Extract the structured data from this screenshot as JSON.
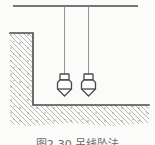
{
  "figure": {
    "caption": "图2-30 吊线坠法",
    "colors": {
      "line": "#4a4a4a",
      "string": "#8a8a8a",
      "hatch": "#9b9b9b",
      "speck": "#8f8f8f",
      "paper": "#fbfbfa",
      "bob-fill": "#fdfdfd",
      "caption": "#6a6a6a"
    }
  }
}
